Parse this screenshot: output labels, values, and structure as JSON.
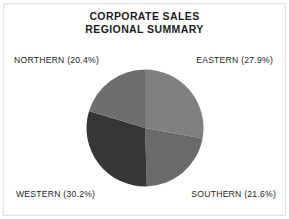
{
  "chart_data": {
    "type": "pie",
    "title": "CORPORATE SALES REGIONAL SUMMARY",
    "title_line1": "CORPORATE SALES",
    "title_line2": "REGIONAL SUMMARY",
    "categories": [
      "EASTERN",
      "SOUTHERN",
      "WESTERN",
      "NORTHERN"
    ],
    "values": [
      27.9,
      21.6,
      30.2,
      20.4
    ],
    "value_unit": "%",
    "start_angle_deg": 0,
    "direction": "clockwise",
    "legend": "none",
    "labels_position": "outside-corners",
    "slices": [
      {
        "name": "EASTERN",
        "label": "EASTERN (27.9%)",
        "value": 27.9,
        "color": "#7f7f7f",
        "start_deg": 0.0,
        "end_deg": 100.4,
        "position": "top-right"
      },
      {
        "name": "SOUTHERN",
        "label": "SOUTHERN (21.6%)",
        "value": 21.6,
        "color": "#6a6a6a",
        "start_deg": 100.4,
        "end_deg": 178.2,
        "position": "bottom-right"
      },
      {
        "name": "WESTERN",
        "label": "WESTERN (30.2%)",
        "value": 30.2,
        "color": "#363636",
        "start_deg": 178.2,
        "end_deg": 287.0,
        "position": "bottom-left"
      },
      {
        "name": "NORTHERN",
        "label": "NORTHERN (20.4%)",
        "value": 20.4,
        "color": "#6e6e6e",
        "start_deg": 287.0,
        "end_deg": 360.0,
        "position": "top-left"
      }
    ],
    "background_color": "#ffffff",
    "text_color": "#1d1d1d"
  }
}
